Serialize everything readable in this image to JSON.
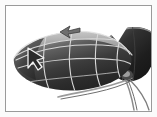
{
  "app": {
    "title": "3D Viewport",
    "background_color": "#ffffff",
    "frame_color": "#9a9a9a",
    "matte_color": "#fbfbfb"
  },
  "viewport": {
    "name": "perspective-viewport",
    "width": 145,
    "height": 105
  },
  "scene": {
    "objects": [
      {
        "name": "primary-leaf-ellipsoid",
        "label": "Leaf Body",
        "shape": "ellipsoid",
        "fill_dark": "#2e2e2e",
        "fill_mid": "#4a4a4a",
        "fill_light": "#8d8d8d",
        "highlight_color": "#b9b9b9",
        "outline_color": "#e8e8e8"
      },
      {
        "name": "secondary-leaf-ellipsoid",
        "label": "Back Leaf",
        "shape": "ellipsoid",
        "fill_dark": "#1d1d1d",
        "fill_mid": "#3a3a3a",
        "highlight_color": "#6d6d6d"
      },
      {
        "name": "stem-tendrils",
        "label": "Stems",
        "stroke_color": "#8e8e8e",
        "count": 3
      }
    ],
    "wireframe": {
      "name": "surface-isolines",
      "stroke_color": "#d8d8d8",
      "longitude_lines": 4,
      "latitude_lines": 3,
      "stroke_width": 1.1
    }
  },
  "cursor": {
    "name": "mouse-pointer",
    "label": "Pointer",
    "x": 26,
    "y": 47,
    "fill_color": "#2b2b2b",
    "stroke_color": "#f2f2f2"
  },
  "marker": {
    "name": "direction-arrow-marker",
    "label": "Direction Arrow",
    "x": 62,
    "y": 24,
    "fill_color": "#6e6e6e",
    "stroke_color": "#3a3a3a"
  },
  "accessibility": {
    "scene_description": "Shaded 3D leaf-shaped ellipsoid with wireframe isolines, a second dark ellipsoid behind it to the right, thin stems below, a mouse pointer over the left tip and a small gray arrow marker above."
  }
}
